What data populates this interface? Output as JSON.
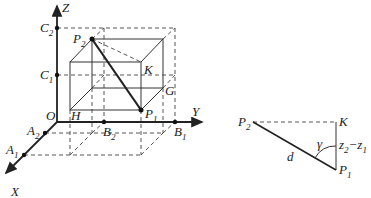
{
  "figure_left": {
    "axes": {
      "z": "Z",
      "y": "Y",
      "x": "X",
      "origin": "O"
    },
    "points": {
      "C2": {
        "main": "C",
        "sub": "2"
      },
      "C1": {
        "main": "C",
        "sub": "1"
      },
      "A2": {
        "main": "A",
        "sub": "2"
      },
      "A1": {
        "main": "A",
        "sub": "1"
      },
      "B2": {
        "main": "B",
        "sub": "2"
      },
      "B1": {
        "main": "B",
        "sub": "1"
      },
      "P2": {
        "main": "P",
        "sub": "2"
      },
      "P1": {
        "main": "P",
        "sub": "1"
      },
      "K": "K",
      "G": "G",
      "H": "H"
    }
  },
  "figure_right": {
    "P2": {
      "main": "P",
      "sub": "2"
    },
    "P1": {
      "main": "P",
      "sub": "1"
    },
    "K": "K",
    "d": "d",
    "gamma": "γ",
    "side": {
      "a": "z",
      "a_sub": "2",
      "minus": "−",
      "b": "z",
      "b_sub": "1"
    }
  }
}
